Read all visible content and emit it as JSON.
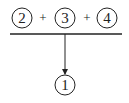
{
  "diagram": {
    "inputs": [
      {
        "label": "2",
        "cx": 22,
        "cy": 18
      },
      {
        "label": "3",
        "cx": 65,
        "cy": 18
      },
      {
        "label": "4",
        "cx": 107,
        "cy": 18
      }
    ],
    "operators": [
      {
        "label": "+",
        "x": 43,
        "y": 22
      },
      {
        "label": "+",
        "x": 87,
        "y": 22
      }
    ],
    "output": {
      "label": "1",
      "cx": 65,
      "cy": 85
    },
    "line_color": "#222222",
    "circle_radius": 10
  }
}
